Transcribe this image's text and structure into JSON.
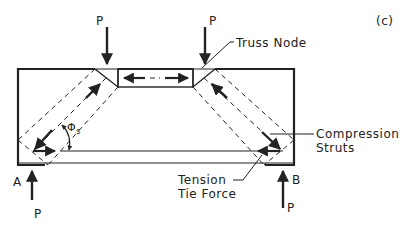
{
  "figure": {
    "panel_label": "(c)",
    "colors": {
      "ink": "#222222",
      "background": "#ffffff"
    }
  },
  "labels": {
    "load_left": "P",
    "load_right": "P",
    "reaction_left": "P",
    "reaction_right": "P",
    "support_left": "A",
    "support_right": "B",
    "truss_node": "Truss Node",
    "compression_line1": "Compression",
    "compression_line2": "Struts",
    "tension_line1": "Tension",
    "tension_line2": "Tie Force",
    "angle_symbol": "Φ",
    "angle_subscript": "s"
  }
}
